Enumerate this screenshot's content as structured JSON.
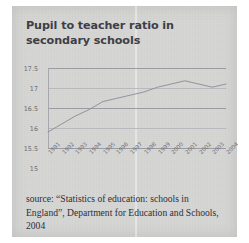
{
  "page": {
    "background_color": "#d6d6d4",
    "source_note": "source: “Statistics of education: schools in England”, Department for Education and Schools, 2004"
  },
  "chart_data": {
    "type": "line",
    "title": "Pupil to teacher ratio in secondary schools",
    "xlabel": "",
    "ylabel": "",
    "ylim": [
      15,
      17.5
    ],
    "yticks": [
      "15",
      "15.5",
      "16",
      "16.5",
      "17",
      "17.5"
    ],
    "ytick_values": [
      15,
      15.5,
      16,
      16.5,
      17,
      17.5
    ],
    "grid": true,
    "legend": false,
    "line_color": "#8b8b92",
    "categories": [
      "1991",
      "1992",
      "1993",
      "1994",
      "1995",
      "1996",
      "1997",
      "1998",
      "1999",
      "2000",
      "2001",
      "2002",
      "2003",
      "2004"
    ],
    "values": [
      15.5,
      15.75,
      16.0,
      16.2,
      16.45,
      16.55,
      16.65,
      16.75,
      16.9,
      17.0,
      17.1,
      17.0,
      16.9,
      17.0
    ]
  },
  "axis": {
    "y_tick_labels": [
      "17.5",
      "17",
      "16.5",
      "16",
      "15.5",
      "15"
    ],
    "x_tick_labels": [
      "1991",
      "1992",
      "1993",
      "1994",
      "1995",
      "1996",
      "1997",
      "1998",
      "1999",
      "2000",
      "2001",
      "2002",
      "2003",
      "2004"
    ]
  }
}
